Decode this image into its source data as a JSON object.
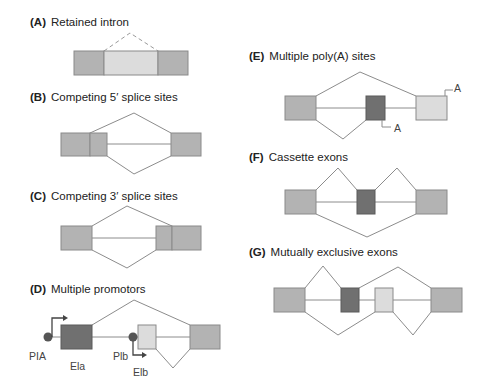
{
  "panels": {
    "A": {
      "tag": "(A)",
      "title": "Retained intron"
    },
    "B": {
      "tag": "(B)",
      "title": "Competing 5′ splice sites"
    },
    "C": {
      "tag": "(C)",
      "title": "Competing 3′ splice sites"
    },
    "D": {
      "tag": "(D)",
      "title": "Multiple promotors",
      "labels": {
        "promoter_a": "PIA",
        "exon_a": "Ela",
        "promoter_b": "Plb",
        "exon_b": "Elb"
      }
    },
    "E": {
      "tag": "(E)",
      "title": "Multiple poly(A) sites",
      "labels": {
        "polya_upper": "A",
        "polya_lower": "A"
      }
    },
    "F": {
      "tag": "(F)",
      "title": "Cassette exons"
    },
    "G": {
      "tag": "(G)",
      "title": "Mutually exclusive exons"
    }
  },
  "colors": {
    "constitutive_exon": "#b3b3b3",
    "alternative_exon_dark": "#707070",
    "alternative_exon_light": "#dcdcdc",
    "intron_line": "#8c8c8c"
  }
}
